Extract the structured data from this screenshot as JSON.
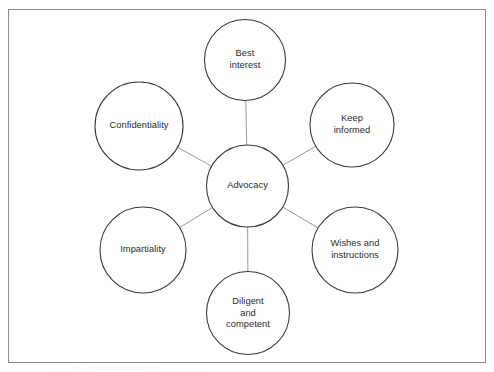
{
  "diagram": {
    "type": "hub-and-spoke",
    "background_color": "#ffffff",
    "frame": {
      "border_color": "#8c8f92",
      "border_width": 1
    },
    "style": {
      "circle_stroke_color": "#3a3a3a",
      "circle_stroke_width": 1.1,
      "circle_fill": "#ffffff",
      "connector_color": "#8a8d90",
      "connector_width": 0.9,
      "text_color": "#2b2b2b"
    },
    "center": {
      "id": "advocacy",
      "label": "Advocacy",
      "cx": 247.5,
      "cy": 186,
      "r": 41
    },
    "nodes": [
      {
        "id": "best-interest",
        "label": "Best\ninterest",
        "cx": 245,
        "cy": 60,
        "r": 40.5
      },
      {
        "id": "keep-informed",
        "label": "Keep\ninformed",
        "cx": 352,
        "cy": 125,
        "r": 42
      },
      {
        "id": "wishes-and-instructions",
        "label": "Wishes and\ninstructions",
        "cx": 355,
        "cy": 250,
        "r": 43
      },
      {
        "id": "diligent-and-competent",
        "label": "Diligent\nand\ncompetent",
        "cx": 248,
        "cy": 313,
        "r": 41.5
      },
      {
        "id": "impartiality",
        "label": "Impartiality",
        "cx": 143,
        "cy": 250,
        "r": 43
      },
      {
        "id": "confidentiality",
        "label": "Confidentiality",
        "cx": 139,
        "cy": 126,
        "r": 44
      }
    ]
  }
}
